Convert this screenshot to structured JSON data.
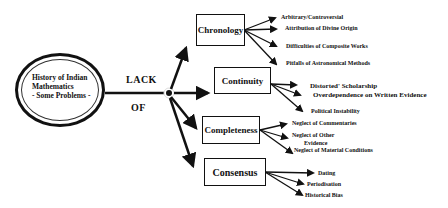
{
  "center": {
    "lines": [
      "History of Indian",
      "Mathematics",
      "- Some Problems -"
    ]
  },
  "connector": {
    "top": "LACK",
    "bottom": "OF"
  },
  "categories": [
    {
      "label": "Chronology",
      "items": [
        "Arbitrary/Controversial",
        "Attribution of Divine Origin",
        "Difficulties of Composite Works",
        "Pitfalls  of Astronomical  Methods"
      ]
    },
    {
      "label": "Continuity",
      "items": [
        "Distorted' Scholarship",
        "Overdependence on Written Evidence",
        "Political Instability"
      ]
    },
    {
      "label": "Completeness",
      "items": [
        "Neglect  of  Commentaries",
        "Neglect of  Other",
        "Evidence",
        "Neglect of Material  Conditions"
      ]
    },
    {
      "label": "Consensus",
      "items": [
        "Dating",
        "Periodisation",
        "Historical Bias"
      ]
    }
  ]
}
